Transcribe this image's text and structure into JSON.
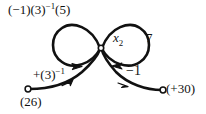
{
  "figure": {
    "type": "signal-flow-graph",
    "background_color": "#ffffff",
    "stroke_color": "#111111",
    "node_fill_color": "#ffffff"
  },
  "labels": {
    "top_loop_gain": {
      "full": "(−1)(3)−1(5)",
      "prefix": "(−1)(3)",
      "exponent": "−1",
      "suffix": "(5)"
    },
    "center_node": {
      "symbol": "x",
      "subscript": "2"
    },
    "right_loop_gain": "7",
    "left_branch_gain": {
      "full": "+(3)−1",
      "prefix": "+(3)",
      "exponent": "−1"
    },
    "right_branch_gain": "−1",
    "source_left": "(26)",
    "source_right": "(+30)"
  },
  "nodes": [
    {
      "id": "center-node",
      "label": "x2",
      "x": 101,
      "y": 48,
      "style": "hollow"
    },
    {
      "id": "source-left-node",
      "label": "(26)",
      "x": 28,
      "y": 89,
      "style": "hollow"
    },
    {
      "id": "source-right-node",
      "label": "(+30)",
      "x": 163,
      "y": 90,
      "style": "hollow"
    }
  ],
  "edges": [
    {
      "id": "left-self-loop",
      "from": "center-node",
      "to": "center-node",
      "gain": "(−1)(3)−1(5)",
      "arrow_direction": "right"
    },
    {
      "id": "right-self-loop",
      "from": "center-node",
      "to": "center-node",
      "gain": "7",
      "arrow_direction": "left"
    },
    {
      "id": "left-input-edge",
      "from": "source-left-node",
      "to": "center-node",
      "gain": "+(3)−1",
      "arrow_direction": "up-right"
    },
    {
      "id": "right-input-edge",
      "from": "source-right-node",
      "to": "center-node",
      "gain": "−1",
      "arrow_direction": "up-left"
    }
  ]
}
